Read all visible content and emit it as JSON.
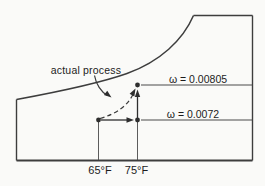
{
  "figure": {
    "annotation": "actual process",
    "humidity_lines": [
      {
        "label": "ω = 0.00805",
        "omega": 0.00805
      },
      {
        "label": "ω = 0.0072",
        "omega": 0.0072
      }
    ],
    "temperature_labels": [
      {
        "label": "65°F",
        "value_F": 65
      },
      {
        "label": "75°F",
        "value_F": 75
      }
    ],
    "colors": {
      "background": "#fafaf8",
      "line": "#3d3d3d",
      "text": "#1c1c1c"
    }
  },
  "diagram_data": {
    "type": "psychrometric-chart-sketch",
    "process": {
      "name": "actual process",
      "path": "dashed curve from state 1 to state 2",
      "state_1": {
        "dry_bulb_F": 65,
        "humidity_ratio": 0.0072
      },
      "state_2": {
        "dry_bulb_F": 75,
        "humidity_ratio": 0.00805
      },
      "idealized_steps": [
        "horizontal arrow: 65°F to 75°F at ω = 0.0072",
        "vertical arrow: ω = 0.0072 to ω = 0.00805 at 75°F"
      ]
    },
    "boundary": "saturation curve upper-left, vertical axes left and right, horizontal base"
  }
}
